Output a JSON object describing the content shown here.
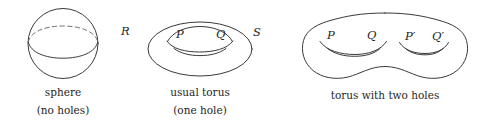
{
  "figure": {
    "background_color": "#ffffff",
    "stroke_color": "#3a3a3a",
    "dashed_stroke_color": "#6d6d6d",
    "text_color": "#262626"
  },
  "panels": [
    {
      "id": "sphere",
      "shape": "sphere",
      "caption_line1": "sphere",
      "caption_line2": "(no holes)",
      "genus": 0,
      "point_labels": []
    },
    {
      "id": "usual-torus",
      "shape": "torus",
      "caption_line1": "usual torus",
      "caption_line2": "(one hole)",
      "genus": 1,
      "point_labels": [
        {
          "id": "R",
          "text": "R"
        },
        {
          "id": "P",
          "text": "P"
        },
        {
          "id": "Q",
          "text": "Q"
        },
        {
          "id": "S",
          "text": "S"
        }
      ]
    },
    {
      "id": "double-torus",
      "shape": "genus-two-surface",
      "caption_line1": "torus with two holes",
      "caption_line2": "",
      "genus": 2,
      "point_labels": [
        {
          "id": "P",
          "text": "P"
        },
        {
          "id": "Q",
          "text": "Q"
        },
        {
          "id": "Pprime",
          "text": "P′"
        },
        {
          "id": "Qprime",
          "text": "Q′"
        }
      ]
    }
  ]
}
